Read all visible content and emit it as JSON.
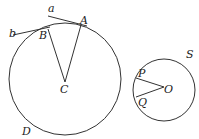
{
  "labels": {
    "a": "a",
    "A": "A",
    "b": "b",
    "B": "B",
    "C": "C",
    "D": "D",
    "S": "S",
    "P": "P",
    "Q": "Q",
    "O": "O"
  },
  "colors": {
    "stroke": "#333333",
    "background": "#ffffff"
  }
}
